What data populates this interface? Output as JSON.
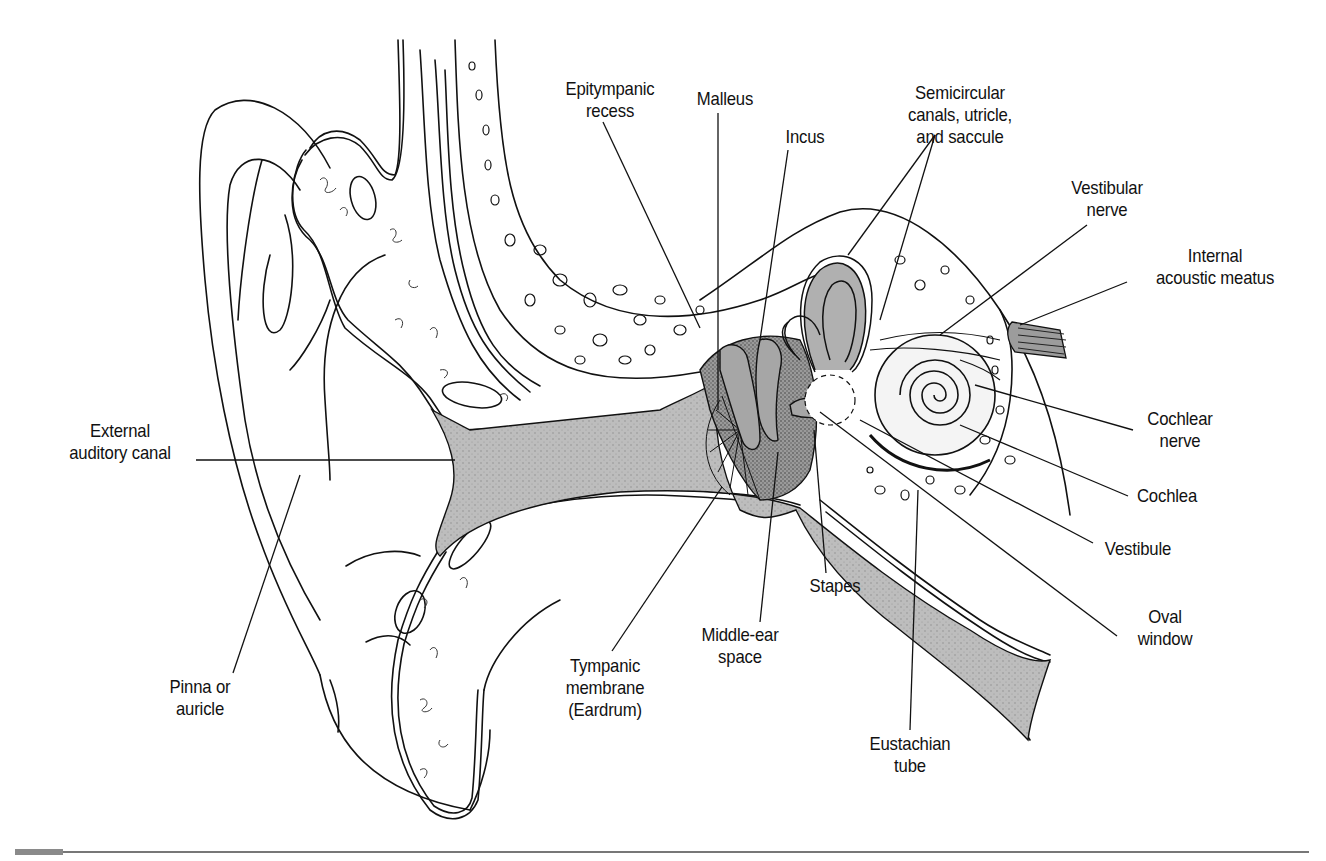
{
  "figure": {
    "shading_color": "#b9b9b9",
    "stipple_color": "#6e6e6e",
    "line_color": "#111111"
  },
  "labels": {
    "epitympanic_recess": [
      "Epitympanic",
      "recess"
    ],
    "malleus": [
      "Malleus"
    ],
    "incus": [
      "Incus"
    ],
    "semicircular": [
      "Semicircular",
      "canals, utricle,",
      "and saccule"
    ],
    "vestibular_nerve": [
      "Vestibular",
      "nerve"
    ],
    "internal_acoustic_meatus": [
      "Internal",
      "acoustic meatus"
    ],
    "external_auditory_canal": [
      "External",
      "auditory canal"
    ],
    "cochlear_nerve": [
      "Cochlear",
      "nerve"
    ],
    "cochlea": [
      "Cochlea"
    ],
    "vestibule": [
      "Vestibule"
    ],
    "stapes": [
      "Stapes"
    ],
    "oval_window": [
      "Oval",
      "window"
    ],
    "middle_ear_space": [
      "Middle-ear",
      "space"
    ],
    "pinna": [
      "Pinna or",
      "auricle"
    ],
    "tympanic_membrane": [
      "Tympanic",
      "membrane",
      "(Eardrum)"
    ],
    "eustachian_tube": [
      "Eustachian",
      "tube"
    ]
  }
}
